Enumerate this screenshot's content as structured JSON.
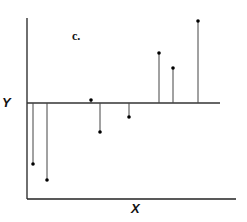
{
  "chart_data": {
    "type": "scatter",
    "title": "c.",
    "xlabel": "X",
    "ylabel": "Y",
    "reference_line_y_px": 103,
    "points_px": [
      {
        "x": 33,
        "y": 164
      },
      {
        "x": 47,
        "y": 180
      },
      {
        "x": 91,
        "y": 100
      },
      {
        "x": 100,
        "y": 132
      },
      {
        "x": 129,
        "y": 117
      },
      {
        "x": 159,
        "y": 53
      },
      {
        "x": 173,
        "y": 68
      },
      {
        "x": 198,
        "y": 21
      }
    ],
    "residuals_relative": [
      -61,
      -77,
      3,
      -29,
      -14,
      50,
      35,
      82
    ],
    "grid": false
  },
  "labels": {
    "panel": "c.",
    "x_axis": "X",
    "y_axis": "Y"
  },
  "colors": {
    "axis": "#222222",
    "stem": "#444444",
    "point": "#000000"
  }
}
